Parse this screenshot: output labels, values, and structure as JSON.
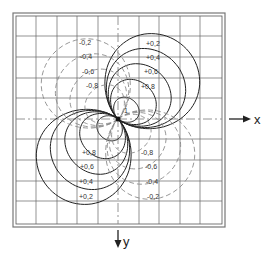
{
  "diagram": {
    "type": "contour-plot",
    "center_label": "1",
    "axes": {
      "x_label": "x",
      "y_label": "y"
    },
    "positive_levels": [
      "+0,2",
      "+0,4",
      "+0,6",
      "+0,8"
    ],
    "negative_levels": [
      "-0,2",
      "-0,4",
      "-0,6",
      "-0,8"
    ],
    "lobes": [
      {
        "quadrant": "upper-right",
        "sign": "positive",
        "style": "solid",
        "labels": [
          "+0,2",
          "+0,4",
          "+0,6",
          "+0,8"
        ]
      },
      {
        "quadrant": "lower-left",
        "sign": "positive",
        "style": "solid",
        "labels": [
          "+0,8",
          "+0,6",
          "+0,4",
          "+0,2"
        ]
      },
      {
        "quadrant": "upper-left",
        "sign": "negative",
        "style": "dashed",
        "labels": [
          "-0,2",
          "-0,4",
          "-0,6",
          "-0,8"
        ]
      },
      {
        "quadrant": "lower-right",
        "sign": "negative",
        "style": "dashed",
        "labels": [
          "-0,8",
          "-0,6",
          "-0,4",
          "-0,2"
        ]
      }
    ],
    "grid": {
      "divisions": 10
    },
    "colors": {
      "positive_line": "#222222",
      "negative_line": "#888888",
      "grid": "#555555",
      "frame": "#666666"
    }
  }
}
